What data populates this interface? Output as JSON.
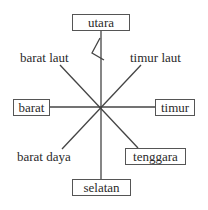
{
  "diagram": {
    "title": "",
    "boxes": {
      "north": "utara",
      "west": "barat",
      "east": "timur",
      "southeast": "tenggara",
      "south": "selatan"
    },
    "labels": {
      "northwest": "barat laut",
      "northeast": "timur laut",
      "southwest": "barat daya"
    },
    "colors": {
      "line": "#444444",
      "text": "#2a2a2a",
      "box_border": "#555555"
    }
  }
}
